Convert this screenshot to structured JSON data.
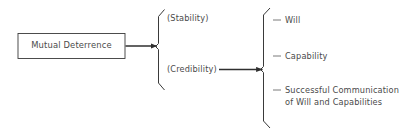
{
  "diagram": {
    "type": "flow-brace-diagram",
    "background_color": "#ffffff",
    "line_color": "#3a3a3a",
    "text_color": "#4a4a4a",
    "source_box": {
      "label": "Mutual Deterrence"
    },
    "first_group": {
      "brace_name": "stability-credibility-brace",
      "items": [
        {
          "label": "(Stability)"
        },
        {
          "label": "(Credibility)"
        }
      ]
    },
    "second_group": {
      "brace_name": "credibility-components-brace",
      "items": [
        {
          "label": "Will",
          "bullet": "dash"
        },
        {
          "label": "Capability",
          "bullet": "dash"
        },
        {
          "label": "Successful Communication of Will and Capabilities",
          "bullet": "dash"
        }
      ]
    },
    "connectors": [
      {
        "name": "box-to-first-brace-arrow",
        "from": "Mutual Deterrence",
        "to": "(Stability)/(Credibility) brace"
      },
      {
        "name": "credibility-to-second-brace-arrow",
        "from": "(Credibility)",
        "to": "Will/Capability/Communication brace"
      }
    ]
  }
}
